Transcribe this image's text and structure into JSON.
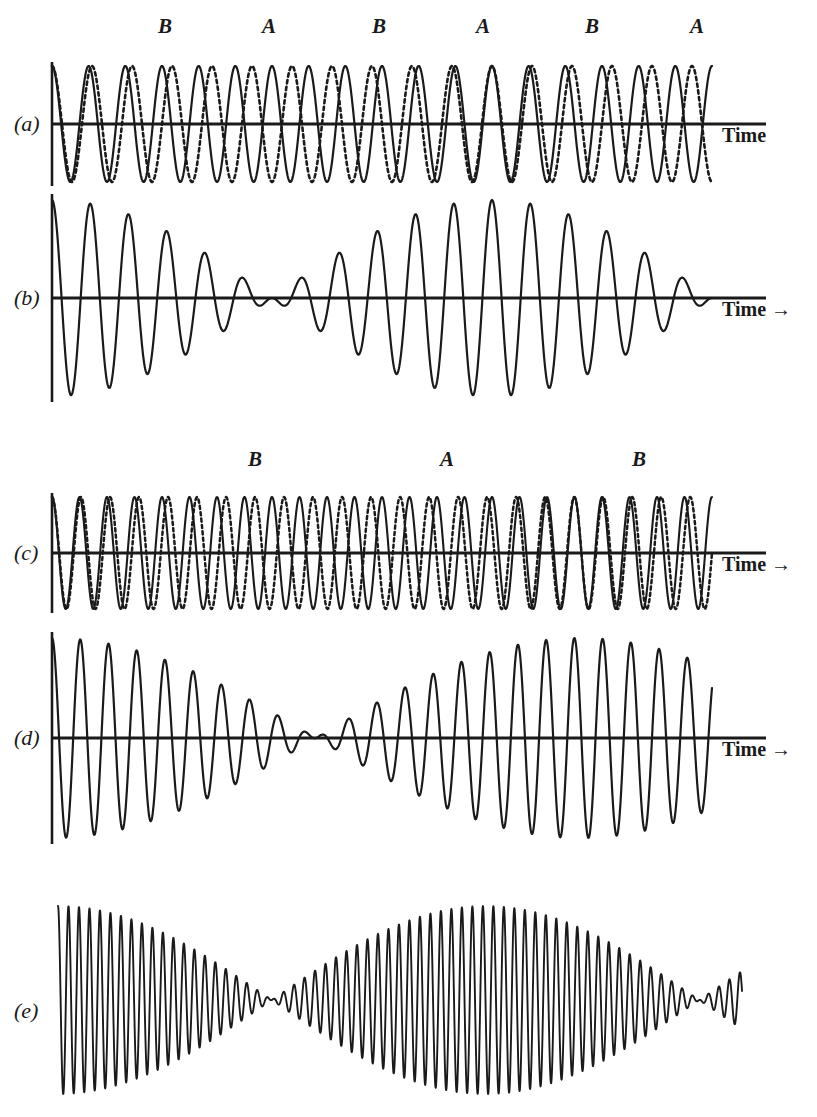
{
  "figure": {
    "background_color": "#ffffff",
    "ink_color": "#1a1a1a",
    "width": 817,
    "height": 1117
  },
  "beat_labels_top": [
    {
      "text": "B",
      "x": 158,
      "y": 14
    },
    {
      "text": "A",
      "x": 262,
      "y": 14
    },
    {
      "text": "B",
      "x": 372,
      "y": 14
    },
    {
      "text": "A",
      "x": 476,
      "y": 14
    },
    {
      "text": "B",
      "x": 585,
      "y": 14
    },
    {
      "text": "A",
      "x": 690,
      "y": 14
    }
  ],
  "beat_labels_middle": [
    {
      "text": "B",
      "x": 248,
      "y": 447
    },
    {
      "text": "A",
      "x": 440,
      "y": 447
    },
    {
      "text": "B",
      "x": 632,
      "y": 447
    }
  ],
  "panels": [
    {
      "id": "a",
      "label": "(a)",
      "label_x": 14,
      "label_y": 111,
      "time_label": "Time",
      "time_arrow": false,
      "time_x": 722,
      "time_y": 124,
      "axis_y": 124,
      "axis_x0": 52,
      "axis_x1": 766,
      "description": "Two component waves A and B of slightly different frequency, drawn solid and dotted"
    },
    {
      "id": "b",
      "label": "(b)",
      "label_x": 14,
      "label_y": 285,
      "time_label": "Time",
      "time_arrow": true,
      "time_x": 722,
      "time_y": 298,
      "axis_y": 298,
      "axis_x0": 52,
      "axis_x1": 766,
      "description": "Resultant superposition of the two waves in (a) showing beats"
    },
    {
      "id": "c",
      "label": "(c)",
      "label_x": 14,
      "label_y": 540,
      "time_label": "Time",
      "time_arrow": true,
      "time_x": 722,
      "time_y": 553,
      "axis_y": 553,
      "axis_x0": 52,
      "axis_x1": 766,
      "description": "Two component waves with smaller frequency difference, solid and dotted"
    },
    {
      "id": "d",
      "label": "(d)",
      "label_x": 14,
      "label_y": 725,
      "time_label": "Time",
      "time_arrow": true,
      "time_x": 722,
      "time_y": 738,
      "axis_y": 738,
      "axis_x0": 52,
      "axis_x1": 766,
      "description": "Resultant superposition of the two waves in (c) showing slower beats"
    },
    {
      "id": "e",
      "label": "(e)",
      "label_x": 14,
      "label_y": 998,
      "time_label": "",
      "time_arrow": false,
      "time_x": 0,
      "time_y": 0,
      "axis_y": 1000,
      "axis_x0": 0,
      "axis_x1": 0,
      "description": "High frequency beat pattern, no time axis drawn"
    }
  ],
  "chart_data": {
    "type": "line",
    "xlabel": "Time",
    "ylabel": "",
    "grid": false,
    "legend": "none",
    "panels": [
      {
        "id": "a",
        "x_range": [
          52,
          712
        ],
        "amplitude": 58,
        "baseline_y": 124,
        "series": [
          {
            "name": "A",
            "style": "solid",
            "cycles": 18.0,
            "phase": 0.0,
            "amplitude": 58
          },
          {
            "name": "B",
            "style": "dotted",
            "cycles": 16.5,
            "phase": 0.0,
            "amplitude": 58
          }
        ]
      },
      {
        "id": "b",
        "x_range": [
          52,
          712
        ],
        "amplitude": 98,
        "baseline_y": 298,
        "series": [
          {
            "name": "A+B",
            "style": "solid",
            "cycles_carrier": 17.25,
            "cycles_envelope": 0.75,
            "amplitude": 98
          }
        ]
      },
      {
        "id": "c",
        "x_range": [
          52,
          712
        ],
        "amplitude": 56,
        "baseline_y": 553,
        "series": [
          {
            "name": "A",
            "style": "solid",
            "cycles": 24.0,
            "phase": 0.0,
            "amplitude": 56
          },
          {
            "name": "B",
            "style": "dotted",
            "cycles": 22.75,
            "phase": 0.0,
            "amplitude": 56
          }
        ]
      },
      {
        "id": "d",
        "x_range": [
          52,
          712
        ],
        "amplitude": 100,
        "baseline_y": 738,
        "series": [
          {
            "name": "A+B",
            "style": "solid",
            "cycles_carrier": 23.375,
            "cycles_envelope": 0.625,
            "amplitude": 100
          }
        ]
      },
      {
        "id": "e",
        "x_range": [
          58,
          742
        ],
        "amplitude": 94,
        "baseline_y": 1000,
        "series": [
          {
            "name": "A+B",
            "style": "solid",
            "cycles_carrier": 66.0,
            "cycles_envelope": 1.6,
            "amplitude": 94
          }
        ]
      }
    ]
  }
}
